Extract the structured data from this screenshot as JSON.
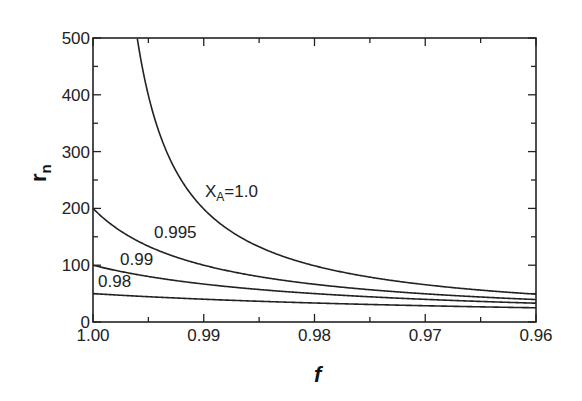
{
  "chart_data": {
    "type": "line",
    "title": "",
    "xlabel": "f",
    "ylabel": "r_n",
    "xlim": [
      1.0,
      0.96
    ],
    "ylim": [
      0,
      500
    ],
    "x_ticks": [
      "1.00",
      "0.99",
      "0.98",
      "0.97",
      "0.96"
    ],
    "y_ticks": [
      "0",
      "100",
      "200",
      "300",
      "400",
      "500"
    ],
    "grid": false,
    "legend": "inline labels",
    "x": [
      1.0,
      0.995,
      0.99,
      0.985,
      0.98,
      0.975,
      0.97,
      0.965,
      0.96
    ],
    "series": [
      {
        "name": "X_A=1.0",
        "label": "X",
        "label_sub": "A",
        "label_rest": "=1.0",
        "values": [
          null,
          399,
          199,
          132,
          99,
          79,
          66,
          56,
          49
        ]
      },
      {
        "name": "0.995",
        "label": "0.995",
        "values": [
          200,
          133,
          100,
          80,
          66,
          57,
          50,
          44,
          40
        ]
      },
      {
        "name": "0.99",
        "label": "0.99",
        "values": [
          100,
          80,
          67,
          57,
          50,
          44,
          40,
          36,
          33
        ]
      },
      {
        "name": "0.98",
        "label": "0.98",
        "values": [
          50,
          44,
          40,
          36,
          33,
          31,
          29,
          27,
          25
        ]
      }
    ]
  }
}
